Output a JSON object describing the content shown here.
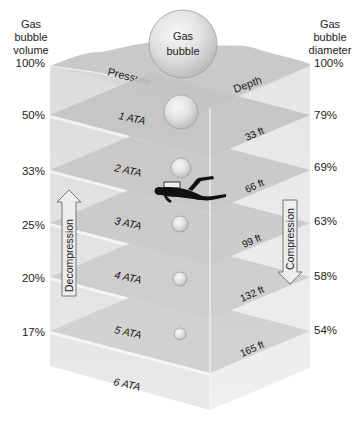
{
  "left_axis": {
    "title_line1": "Gas",
    "title_line2": "bubble",
    "title_line3": "volume",
    "values": [
      "100%",
      "50%",
      "33%",
      "25%",
      "20%",
      "17%"
    ]
  },
  "right_axis": {
    "title_line1": "Gas",
    "title_line2": "bubble",
    "title_line3": "diameter",
    "values": [
      "100%",
      "79%",
      "69%",
      "63%",
      "58%",
      "54%"
    ]
  },
  "surface": {
    "pressure_label": "Pressure",
    "depth_label": "Depth",
    "bubble_line1": "Gas",
    "bubble_line2": "bubble"
  },
  "layers": [
    {
      "pressure": "1 ATA",
      "depth": "33 ft"
    },
    {
      "pressure": "2 ATA",
      "depth": "66 ft"
    },
    {
      "pressure": "3 ATA",
      "depth": "99 ft"
    },
    {
      "pressure": "4 ATA",
      "depth": "132 ft"
    },
    {
      "pressure": "5 ATA",
      "depth": "165 ft"
    },
    {
      "pressure": "6 ATA",
      "depth": ""
    }
  ],
  "arrows": {
    "up_label": "Decompression",
    "down_label": "Compression"
  },
  "diver": {
    "label": "scuba-diver"
  },
  "colors": {
    "water_light": "#e4e4e4",
    "water_mid": "#d2d2d2",
    "layer_dark": "#b9b9b9",
    "layer_light": "#cfcfcf",
    "surface_dark": "#bdbdbd",
    "surface_light": "#d8d8d8",
    "edge": "#ffffff",
    "text": "#222222",
    "diver": "#111111"
  }
}
